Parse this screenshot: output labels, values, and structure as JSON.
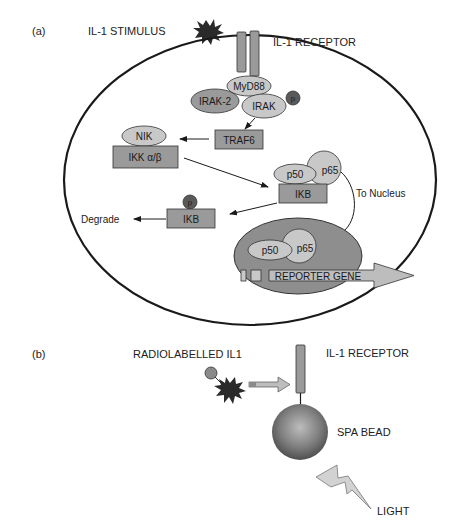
{
  "panel_a": {
    "label": "(a)",
    "stimulus_label": "IL-1 STIMULUS",
    "receptor_label": "IL-1 RECEPTOR",
    "nodes": {
      "myd88": "MyD88",
      "irak2": "IRAK-2",
      "irak": "IRAK",
      "irak_phospho": "p",
      "traf6": "TRAF6",
      "nik": "NIK",
      "ikk": "IKK α/β",
      "p50_cyto": "p50",
      "p65_cyto": "p65",
      "ikb_complex": "IKB",
      "ikb_phospho": "p",
      "ikb_free": "IKB",
      "p50_nuc": "p50",
      "p65_nuc": "p65",
      "reporter_gene": "REPORTER GENE"
    },
    "annotations": {
      "degrade": "Degrade",
      "to_nucleus": "To Nucleus"
    }
  },
  "panel_b": {
    "label": "(b)",
    "ligand_label": "RADIOLABELLED IL1",
    "receptor_label": "IL-1 RECEPTOR",
    "bead_label": "SPA BEAD",
    "light_label": "LIGHT"
  },
  "colors": {
    "box_fill": "#9a9a9a",
    "oval_fill": "#c8c8c8",
    "nucleus_fill": "#8e8e8e",
    "phospho_fill": "#5a5a5a",
    "star_fill": "#2a2a2a",
    "outline": "#1a1a1a"
  }
}
